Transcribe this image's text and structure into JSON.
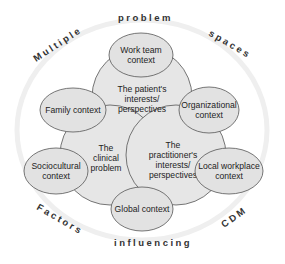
{
  "ring": {
    "top_left": "Multiple",
    "top": "problem",
    "top_right": "spaces",
    "bottom_left": "Factors",
    "bottom": "influencing",
    "bottom_right": "CDM"
  },
  "core": {
    "patient": [
      "The patient's",
      "interests/",
      "perspectives"
    ],
    "clinical": [
      "The",
      "clinical",
      "problem"
    ],
    "practitioner": [
      "The",
      "practitioner's",
      "interests/",
      "perspectives"
    ]
  },
  "contexts": {
    "work_team": [
      "Work team",
      "context"
    ],
    "family": [
      "Family context"
    ],
    "organizational": [
      "Organizational",
      "context"
    ],
    "sociocultural": [
      "Sociocultural",
      "context"
    ],
    "local_workplace": [
      "Local workplace",
      "context"
    ],
    "global": [
      "Global context"
    ]
  },
  "colors": {
    "fill": "#e6e6e6",
    "stroke": "#555555",
    "ring": "#eeeeee",
    "text": "#222222"
  }
}
